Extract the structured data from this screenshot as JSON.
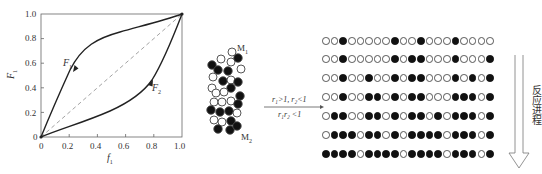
{
  "chart_data": {
    "type": "line",
    "title": "",
    "xlabel": "f1",
    "ylabel": "F1",
    "xlim": [
      0,
      1.0
    ],
    "ylim": [
      0,
      1.0
    ],
    "x_ticks": [
      "0",
      "0.2",
      "0.4",
      "0.6",
      "0.8",
      "1.0"
    ],
    "y_ticks": [
      "0",
      "0.2",
      "0.4",
      "0.6",
      "0.8",
      "1.0"
    ],
    "grid": false,
    "series": [
      {
        "name": "F1",
        "style": "solid",
        "x": [
          0,
          0.1,
          0.2,
          0.25,
          0.3,
          0.4,
          0.5,
          0.6,
          0.7,
          0.8,
          0.9,
          1.0
        ],
        "y": [
          0,
          0.24,
          0.47,
          0.56,
          0.64,
          0.73,
          0.79,
          0.83,
          0.87,
          0.91,
          0.95,
          1.0
        ]
      },
      {
        "name": "F2",
        "style": "solid",
        "x": [
          0,
          0.1,
          0.2,
          0.3,
          0.4,
          0.5,
          0.6,
          0.7,
          0.75,
          0.8,
          0.9,
          1.0
        ],
        "y": [
          0,
          0.05,
          0.1,
          0.15,
          0.19,
          0.23,
          0.29,
          0.38,
          0.45,
          0.54,
          0.75,
          1.0
        ]
      },
      {
        "name": "diagonal",
        "style": "dashed",
        "x": [
          0,
          1.0
        ],
        "y": [
          0,
          1.0
        ]
      }
    ],
    "annotations": [
      "F1",
      "F2"
    ]
  },
  "plot": {
    "x_ticks": [
      "0",
      "0.2",
      "0.4",
      "0.6",
      "0.8",
      "1.0"
    ],
    "y_ticks": [
      "0",
      "0.2",
      "0.4",
      "0.6",
      "0.8",
      "1.0"
    ],
    "xlabel": "f",
    "xlabel_sub": "1",
    "ylabel": "F",
    "ylabel_sub": "1",
    "curve1_label": "F",
    "curve1_sub": "1",
    "curve2_label": "F",
    "curve2_sub": "2"
  },
  "cluster": {
    "label_top": "M",
    "label_top_sub": "1",
    "label_bottom": "M",
    "label_bottom_sub": "2"
  },
  "reaction": {
    "condition_line1": "r₁>1, r₂<1",
    "condition_line2": "r₁r₂ <1"
  },
  "chains": {
    "legend": "0 = white (M1), 1 = black (M2)",
    "rows": [
      "00100000100100010000",
      "00100000101100010001",
      "00100100101100010101",
      "00100110101100011101",
      "01100110101101011101",
      "01110110101111011101",
      "11110111101111011101"
    ]
  },
  "progress": {
    "label": "反应进程"
  }
}
